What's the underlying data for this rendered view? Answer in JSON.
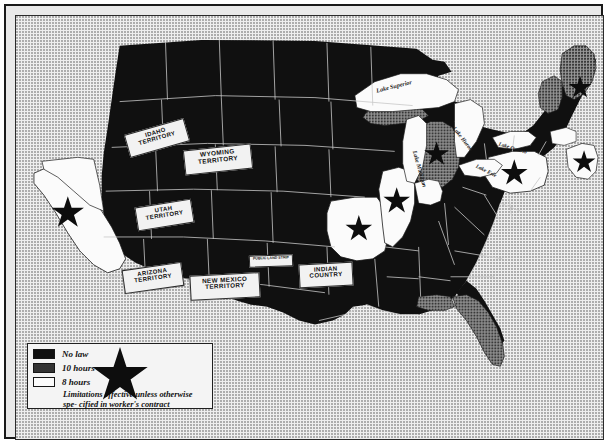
{
  "map": {
    "title": "State maximum-hours laws, United States",
    "background_color": "#eeeeee",
    "no_law_color": "#101010",
    "ten_hours_color": "#8e8e8e",
    "eight_hours_color": "#fbfbfb",
    "border_color": "#1f1f1f"
  },
  "legend": {
    "items": [
      {
        "swatch": "black",
        "label": "No law"
      },
      {
        "swatch": "gray",
        "label": "10 hours"
      },
      {
        "swatch": "white",
        "label": "8 hours"
      }
    ],
    "note_line1": "Limitations effective unless otherwise spe-",
    "note_line2": "cified in worker's contract",
    "star_icon": "star-icon"
  },
  "territory_labels": [
    {
      "id": "idaho",
      "line1": "IDAHO",
      "line2": "TERRITORY",
      "x": 110,
      "y": 110,
      "w": 60,
      "h": 20,
      "size": 6.0,
      "rot": -16
    },
    {
      "id": "wyoming",
      "line1": "WYOMING",
      "line2": "TERRITORY",
      "x": 168,
      "y": 131,
      "w": 66,
      "h": 21,
      "size": 6.4,
      "rot": -6
    },
    {
      "id": "utah",
      "line1": "UTAH",
      "line2": "TERRITORY",
      "x": 120,
      "y": 187,
      "w": 55,
      "h": 20,
      "size": 6.0,
      "rot": -9
    },
    {
      "id": "arizona",
      "line1": "ARIZONA",
      "line2": "TERRITORY",
      "x": 107,
      "y": 250,
      "w": 58,
      "h": 20,
      "size": 6.0,
      "rot": -8
    },
    {
      "id": "new-mexico",
      "line1": "NEW MEXICO",
      "line2": "TERRITORY",
      "x": 174,
      "y": 258,
      "w": 68,
      "h": 21,
      "size": 6.3,
      "rot": -3
    },
    {
      "id": "indian",
      "line1": "INDIAN",
      "line2": "COUNTRY",
      "x": 283,
      "y": 247,
      "w": 52,
      "h": 20,
      "size": 6.2,
      "rot": -3
    },
    {
      "id": "public-land-strip",
      "line1": "PUBLIC LAND STRIP",
      "line2": "",
      "x": 233,
      "y": 239,
      "w": 42,
      "h": 9,
      "size": 3.6,
      "rot": -2
    }
  ],
  "lake_labels": [
    {
      "id": "superior",
      "text": "Lake Superior",
      "x": 362,
      "y": 77,
      "rot": -14,
      "size": 6.2
    },
    {
      "id": "michigan",
      "text": "Lake Michigan",
      "x": 398,
      "y": 136,
      "rot": 74,
      "size": 6.0
    },
    {
      "id": "huron",
      "text": "Lake Huron",
      "x": 438,
      "y": 113,
      "rot": 52,
      "size": 5.8
    },
    {
      "id": "erie",
      "text": "Lake Erie",
      "x": 461,
      "y": 152,
      "rot": 27,
      "size": 5.5
    },
    {
      "id": "ontario",
      "text": "Lake Ontario",
      "x": 484,
      "y": 130,
      "rot": 17,
      "size": 5.3
    }
  ],
  "stars": [
    {
      "id": "california",
      "x": 52,
      "y": 198,
      "r": 17
    },
    {
      "id": "missouri",
      "x": 354,
      "y": 214,
      "r": 14
    },
    {
      "id": "illinois",
      "x": 385,
      "y": 186,
      "r": 14
    },
    {
      "id": "michigan",
      "x": 425,
      "y": 139,
      "r": 13
    },
    {
      "id": "pennsylvania",
      "x": 504,
      "y": 160,
      "r": 14
    },
    {
      "id": "new-jersey",
      "x": 577,
      "y": 149,
      "r": 12
    },
    {
      "id": "maine",
      "x": 573,
      "y": 73,
      "r": 12
    }
  ]
}
